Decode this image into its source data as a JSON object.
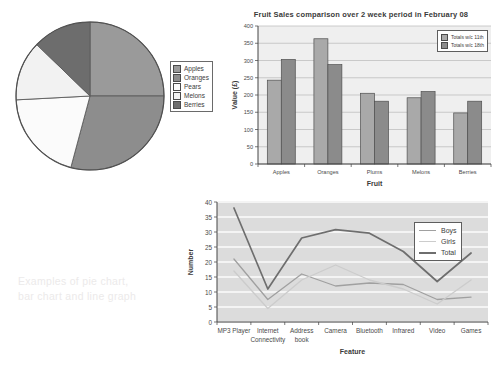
{
  "top_cut_text": "· · ·",
  "caption": {
    "line1": "Examples of pie chart,",
    "line2": "bar chart and line graph"
  },
  "colors": {
    "pie_apples": "#9a9a9a",
    "pie_oranges": "#8d8d8d",
    "pie_pears": "#fbfbfb",
    "pie_melons": "#f2f2f2",
    "pie_berries": "#6d6d6d",
    "bar_series1": "#a9a9a9",
    "bar_series2": "#8b8b8b",
    "line_boys": "#a0a0a0",
    "line_girls": "#cccccc",
    "line_total": "#6e6e6e",
    "plot_band": "#dcdcdc",
    "caption_gray": "#eceaea"
  },
  "chart_data": [
    {
      "type": "pie",
      "title": "",
      "legend_position": "right",
      "labels": [
        "Apples",
        "Oranges",
        "Pears",
        "Melons",
        "Berries"
      ],
      "values": [
        25,
        29,
        20,
        13,
        13
      ],
      "angles_deg": [
        90,
        105,
        72,
        47,
        46
      ],
      "start_angle_deg": 0,
      "direction": "clockwise"
    },
    {
      "type": "bar",
      "title": "Fruit Sales comparison over 2 week period in February 08",
      "xlabel": "Fruit",
      "ylabel": "Value (£)",
      "categories": [
        "Apples",
        "Oranges",
        "Plums",
        "Melons",
        "Berries"
      ],
      "ylim": [
        0,
        400
      ],
      "yticks": [
        0,
        50,
        100,
        150,
        200,
        250,
        300,
        350,
        400
      ],
      "grid": true,
      "series": [
        {
          "name": "Totals w/c 11th",
          "values": [
            243,
            363,
            205,
            192,
            148
          ]
        },
        {
          "name": "Totals w/c 18th",
          "values": [
            303,
            288,
            182,
            210,
            182
          ]
        }
      ]
    },
    {
      "type": "line",
      "title": "",
      "xlabel": "Feature",
      "ylabel": "Number",
      "categories": [
        "MP3 Player",
        "Internet Connectivity",
        "Address book",
        "Camera",
        "Bluetooth",
        "Infrared",
        "Video",
        "Games"
      ],
      "ylim": [
        0,
        40
      ],
      "yticks": [
        0,
        5,
        10,
        15,
        20,
        25,
        30,
        35,
        40
      ],
      "grid": true,
      "legend_position": "top-right",
      "series": [
        {
          "name": "Boys",
          "values": [
            21,
            7.5,
            16,
            12,
            13,
            12.5,
            7.5,
            8.3
          ]
        },
        {
          "name": "Girls",
          "values": [
            17,
            4.5,
            14,
            19,
            14,
            11,
            6,
            14
          ]
        },
        {
          "name": "Total",
          "values": [
            38,
            11,
            28,
            30.8,
            29.6,
            23.5,
            13.5,
            23
          ]
        }
      ]
    }
  ]
}
